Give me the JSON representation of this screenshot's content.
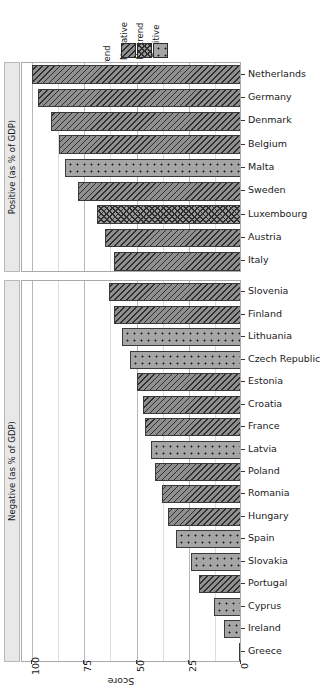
{
  "chart_data": {
    "type": "bar",
    "orientation": "horizontal",
    "title": "",
    "xlabel": "Score",
    "ylabel": "",
    "xlim": [
      100,
      0
    ],
    "x_reversed": true,
    "grid": true,
    "xticks": [
      "100",
      "75",
      "50",
      "25",
      "0"
    ],
    "xtick_values": [
      100,
      75,
      50,
      25,
      0
    ],
    "legend": {
      "title": "Trend",
      "position": "top-center",
      "entries": [
        {
          "label": "Negative",
          "pattern": "diagonal-hatch"
        },
        {
          "label": "No trend",
          "pattern": "crosshatch"
        },
        {
          "label": "Positive",
          "pattern": "dotted"
        }
      ]
    },
    "facets": [
      {
        "label": "Positive (as % of GDP)",
        "categories": [
          "Netherlands",
          "Germany",
          "Denmark",
          "Belgium",
          "Malta",
          "Sweden",
          "Luxembourg",
          "Austria",
          "Italy"
        ],
        "values": [
          100,
          97,
          91,
          87,
          84,
          78,
          69,
          65,
          61
        ],
        "trends": [
          "Negative",
          "Negative",
          "Negative",
          "Negative",
          "Positive",
          "Negative",
          "No trend",
          "Negative",
          "Negative"
        ]
      },
      {
        "label": "Negative (as % of GDP)",
        "categories": [
          "Slovenia",
          "Finland",
          "Lithuania",
          "Czech Republic",
          "Estonia",
          "Croatia",
          "France",
          "Latvia",
          "Poland",
          "Romania",
          "Hungary",
          "Spain",
          "Slovakia",
          "Portugal",
          "Cyprus",
          "Ireland",
          "Greece"
        ],
        "values": [
          63,
          61,
          57,
          53,
          50,
          47,
          46,
          43,
          41,
          38,
          35,
          31,
          24,
          20,
          13,
          8,
          1
        ],
        "trends": [
          "Negative",
          "Negative",
          "Positive",
          "Positive",
          "Negative",
          "Negative",
          "Negative",
          "Positive",
          "Negative",
          "Negative",
          "Negative",
          "Positive",
          "Positive",
          "Negative",
          "Positive",
          "Positive",
          "Positive"
        ]
      }
    ]
  },
  "colors": {
    "bar_fill": "#999999",
    "bar_stroke": "#3a3a3a",
    "panel_border": "#a9a9a9",
    "strip_background": "#e8e8e8",
    "gridline_major": "#b6b6c4",
    "gridline_minor": "#dcdce4",
    "text": "#1a1a1a",
    "background": "#ffffff"
  }
}
